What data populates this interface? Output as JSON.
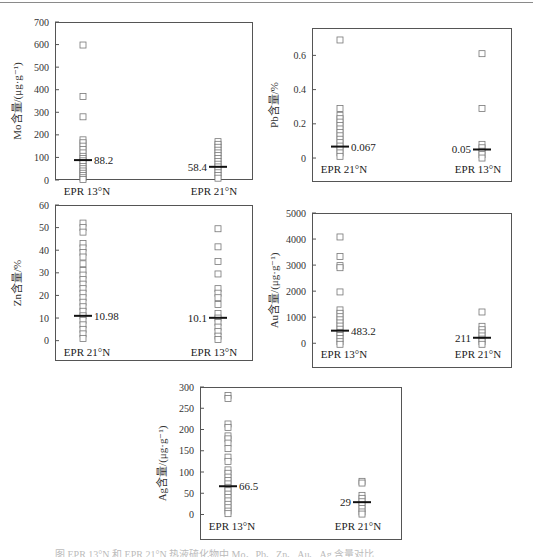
{
  "page": {
    "caption": "图  EPR 13°N 和 EPR 21°N 热液硫化物中 Mo、Pb、Zn、Au、Ag 含量对比"
  },
  "chart_data": [
    {
      "type": "scatter",
      "id": "mo",
      "title": "",
      "xlabel": "",
      "ylabel": "Mo含量/(μg·g⁻¹)",
      "ylim": [
        0,
        700
      ],
      "yticks": [
        0,
        100,
        200,
        300,
        400,
        500,
        600,
        700
      ],
      "categories": [
        "EPR 13°N",
        "EPR 21°N"
      ],
      "series": [
        {
          "name": "EPR 13°N",
          "values": [
            598,
            370,
            280,
            178,
            165,
            150,
            135,
            120,
            105,
            95,
            85,
            75,
            60,
            50,
            40,
            30,
            20,
            10,
            2
          ],
          "mean": 88.2,
          "mean_label": "88.2"
        },
        {
          "name": "EPR 21°N",
          "values": [
            170,
            158,
            145,
            132,
            120,
            108,
            95,
            82,
            70,
            58,
            45,
            32,
            20,
            8
          ],
          "mean": 58.4,
          "mean_label": "58.4"
        }
      ],
      "grid": false,
      "mean_label_side": [
        "right",
        "left"
      ]
    },
    {
      "type": "scatter",
      "id": "pb",
      "title": "",
      "xlabel": "",
      "ylabel": "Pb含量/%",
      "ylim": [
        -0.14,
        0.76
      ],
      "yticks": [
        0,
        0.2,
        0.4,
        0.6
      ],
      "categories": [
        "EPR 21°N",
        "EPR 13°N"
      ],
      "series": [
        {
          "name": "EPR 21°N",
          "values": [
            0.69,
            0.29,
            0.25,
            0.23,
            0.21,
            0.19,
            0.17,
            0.15,
            0.13,
            0.11,
            0.09,
            0.07,
            0.05,
            0.03,
            0.01
          ],
          "mean": 0.067,
          "mean_label": "0.067"
        },
        {
          "name": "EPR 13°N",
          "values": [
            0.61,
            0.29,
            0.08,
            0.06,
            0.04,
            0.02,
            0.0
          ],
          "mean": 0.05,
          "mean_label": "0.05"
        }
      ],
      "grid": false,
      "mean_label_side": [
        "right",
        "left"
      ]
    },
    {
      "type": "scatter",
      "id": "zn",
      "title": "",
      "xlabel": "",
      "ylabel": "Zn含量/%",
      "ylim": [
        -9,
        60
      ],
      "yticks": [
        0,
        10,
        20,
        30,
        40,
        50,
        60
      ],
      "categories": [
        "EPR 21°N",
        "EPR 13°N"
      ],
      "series": [
        {
          "name": "EPR 21°N",
          "values": [
            52,
            50,
            48,
            43,
            41,
            39,
            37,
            34,
            31,
            29,
            27,
            25,
            23,
            21,
            19,
            17,
            15,
            13,
            11,
            9,
            7,
            5,
            3,
            1
          ],
          "mean": 10.98,
          "mean_label": "10.98"
        },
        {
          "name": "EPR 13°N",
          "values": [
            49.5,
            41.5,
            35,
            29.5,
            23,
            21,
            19,
            16,
            12,
            10,
            8,
            6,
            4,
            2,
            0.5
          ],
          "mean": 10.1,
          "mean_label": "10.1"
        }
      ],
      "grid": false,
      "mean_label_side": [
        "right",
        "left"
      ]
    },
    {
      "type": "scatter",
      "id": "au",
      "title": "",
      "xlabel": "",
      "ylabel": "Au含量/(μg·g⁻¹)",
      "ylim": [
        -950,
        5000
      ],
      "yticks": [
        0,
        1000,
        2000,
        3000,
        4000,
        5000
      ],
      "categories": [
        "EPR 13°N",
        "EPR 21°N"
      ],
      "series": [
        {
          "name": "EPR 13°N",
          "values": [
            4080,
            3330,
            2980,
            2900,
            1970,
            1280,
            1150,
            1020,
            900,
            780,
            660,
            540,
            420,
            300,
            180,
            60,
            -40
          ],
          "mean": 483.2,
          "mean_label": "483.2"
        },
        {
          "name": "EPR 21°N",
          "values": [
            1200,
            650,
            520,
            400,
            280,
            160,
            60,
            -40
          ],
          "mean": 211,
          "mean_label": "211"
        }
      ],
      "grid": false,
      "mean_label_side": [
        "right",
        "left"
      ]
    },
    {
      "type": "scatter",
      "id": "ag",
      "title": "",
      "xlabel": "",
      "ylabel": "Ag含量/(μg·g⁻¹)",
      "ylim": [
        -60,
        300
      ],
      "yticks": [
        0,
        50,
        100,
        150,
        200,
        250,
        300
      ],
      "categories": [
        "EPR 13°N",
        "EPR 21°N"
      ],
      "series": [
        {
          "name": "EPR 13°N",
          "values": [
            280,
            273,
            213,
            205,
            185,
            178,
            168,
            155,
            135,
            125,
            105,
            97,
            88,
            80,
            72,
            64,
            56,
            48,
            40,
            32,
            24,
            16,
            8,
            2
          ],
          "mean": 66.5,
          "mean_label": "66.5"
        },
        {
          "name": "EPR 21°N",
          "values": [
            78,
            74,
            45,
            38,
            30,
            22,
            14,
            6,
            1
          ],
          "mean": 29,
          "mean_label": "29"
        }
      ],
      "grid": false,
      "mean_label_side": [
        "right",
        "left"
      ]
    }
  ],
  "layout": {
    "panels": [
      {
        "id": "mo",
        "x": 55,
        "y": 22,
        "w": 198,
        "h": 158,
        "col1": 28,
        "col2": 163
      },
      {
        "id": "pb",
        "x": 312,
        "y": 28,
        "w": 200,
        "h": 154,
        "col1": 28,
        "col2": 170
      },
      {
        "id": "zn",
        "x": 55,
        "y": 205,
        "w": 198,
        "h": 156,
        "col1": 28,
        "col2": 163
      },
      {
        "id": "au",
        "x": 312,
        "y": 213,
        "w": 200,
        "h": 155,
        "col1": 28,
        "col2": 170
      },
      {
        "id": "ag",
        "x": 200,
        "y": 387,
        "w": 202,
        "h": 153,
        "col1": 28,
        "col2": 162
      }
    ]
  }
}
